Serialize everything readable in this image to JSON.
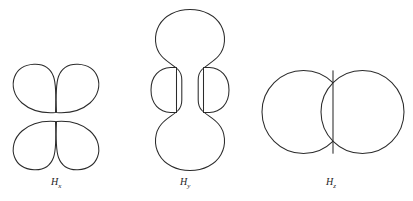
{
  "figure": {
    "background_color": "#ffffff",
    "stroke_color": "#2b2b2b",
    "fill_color": "#ffffff",
    "panels": [
      {
        "id": "hx",
        "caption_base": "H",
        "caption_sub": "x",
        "shape": "four-lobe-cloverleaf",
        "lobes": 4,
        "description": "four teardrop lobes arranged in two stacked pairs"
      },
      {
        "id": "hy",
        "caption_base": "H",
        "caption_sub": "y",
        "shape": "dumbbell-with-torus",
        "lobes": 2,
        "description": "two vertical round lobes joined by a narrow neck with two side half-disc torus profiles"
      },
      {
        "id": "hz",
        "caption_base": "H",
        "caption_sub": "z",
        "shape": "two-large-circles",
        "lobes": 2,
        "description": "two large circles meeting along a vertical line"
      }
    ]
  },
  "captions": {
    "hx": {
      "base": "H",
      "sub": "x"
    },
    "hy": {
      "base": "H",
      "sub": "y"
    },
    "hz": {
      "base": "H",
      "sub": "z"
    }
  },
  "artifacts": {
    "bottom_scan_noise": "               "
  }
}
